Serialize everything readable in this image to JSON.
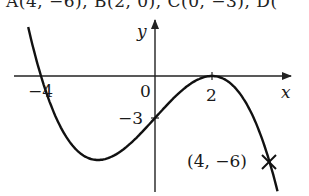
{
  "header": {
    "cut_off_text": "A(4, −6), B(2, 0), C(0, −3), D("
  },
  "graph": {
    "x_axis_label": "x",
    "y_axis_label": "y",
    "origin_label": "0",
    "x_tick_labels": [
      "−4",
      "2"
    ],
    "y_tick_labels": [
      "−3"
    ],
    "point_label": "(4, −6)",
    "point_marker": "cross-icon",
    "curve_color": "#111111",
    "axis_color": "#222222"
  },
  "chart_data": {
    "type": "line",
    "title": "",
    "xlabel": "x",
    "ylabel": "y",
    "function": "y = -(3/16)(x+4)(x-2)^2",
    "x_intercepts": [
      -4,
      2
    ],
    "y_intercept": -3,
    "touching_point": [
      2,
      0
    ],
    "marked_point": [
      4,
      -6
    ],
    "x": [
      -4.5,
      -4,
      -3,
      -2,
      -1,
      0,
      1,
      2,
      3,
      4,
      4.3
    ],
    "values": [
      2.84,
      0,
      -4.69,
      -6.0,
      -5.06,
      -3.0,
      -0.94,
      0,
      -1.31,
      -6.0,
      -8.0
    ],
    "xlim": [
      -5,
      4.8
    ],
    "ylim": [
      -8,
      4
    ],
    "grid": false
  }
}
